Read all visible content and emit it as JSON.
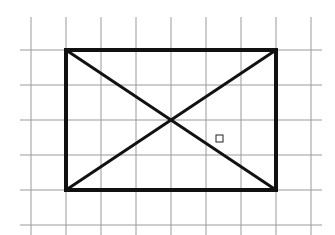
{
  "diagram": {
    "type": "rectangle-with-diagonals-on-grid",
    "grid": {
      "cell_size": 35,
      "vertical_lines_x": [
        31,
        66,
        101,
        136,
        171,
        206,
        241,
        276,
        311
      ],
      "horizontal_lines_y": [
        50,
        85,
        120,
        155,
        190,
        225
      ],
      "v_extent": [
        17,
        235
      ],
      "h_extent": [
        20,
        322
      ],
      "color": "#9a9a9a"
    },
    "rectangle": {
      "x1": 66,
      "y1": 50,
      "x2": 276,
      "y2": 190,
      "width_cells": 6,
      "height_cells": 4,
      "stroke": "#111111",
      "stroke_width": 4
    },
    "diagonals": [
      {
        "from": [
          66,
          50
        ],
        "to": [
          276,
          190
        ]
      },
      {
        "from": [
          276,
          50
        ],
        "to": [
          66,
          190
        ]
      }
    ],
    "marker": {
      "shape": "small-square",
      "x": 216,
      "y": 135,
      "size": 7,
      "stroke": "#222222"
    }
  }
}
